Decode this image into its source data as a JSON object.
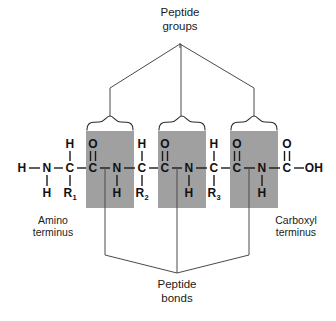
{
  "figure": {
    "title_top": {
      "line1": "Peptide",
      "line2": "groups"
    },
    "title_bottom": {
      "line1": "Peptide",
      "line2": "bonds"
    },
    "label_left": {
      "line1": "Amino",
      "line2": "terminus"
    },
    "label_right": {
      "line1": "Carboxyl",
      "line2": "terminus"
    },
    "colors": {
      "highlight_box": "#a0a0a0",
      "stroke": "#4a4a4a",
      "text": "#111111",
      "background": "#ffffff"
    }
  },
  "backbone": {
    "description": "Tripeptide backbone drawn left to right",
    "main_chain": [
      {
        "id": "h-n-terminal",
        "text": "H",
        "x": 22,
        "y": 168
      },
      {
        "id": "n-terminal",
        "text": "N",
        "x": 47,
        "y": 168
      },
      {
        "id": "c-alpha-1",
        "text": "C",
        "x": 70,
        "y": 168
      },
      {
        "id": "c-carbonyl-1",
        "text": "C",
        "x": 93,
        "y": 168
      },
      {
        "id": "n-amide-1",
        "text": "N",
        "x": 117,
        "y": 168
      },
      {
        "id": "c-alpha-2",
        "text": "C",
        "x": 142,
        "y": 168
      },
      {
        "id": "c-carbonyl-2",
        "text": "C",
        "x": 165,
        "y": 168
      },
      {
        "id": "n-amide-2",
        "text": "N",
        "x": 189,
        "y": 168
      },
      {
        "id": "c-alpha-3",
        "text": "C",
        "x": 214,
        "y": 168
      },
      {
        "id": "c-carbonyl-3",
        "text": "C",
        "x": 237,
        "y": 168
      },
      {
        "id": "n-amide-3",
        "text": "N",
        "x": 262,
        "y": 168
      },
      {
        "id": "c-carboxyl",
        "text": "C",
        "x": 287,
        "y": 168
      },
      {
        "id": "oh-c-terminal",
        "text": "OH",
        "x": 314,
        "y": 168
      }
    ],
    "substituents": [
      {
        "id": "oxygen-1",
        "text": "O",
        "x": 93,
        "y": 144
      },
      {
        "id": "oxygen-2",
        "text": "O",
        "x": 165,
        "y": 144
      },
      {
        "id": "oxygen-3",
        "text": "O",
        "x": 237,
        "y": 144
      },
      {
        "id": "oxygen-carboxyl",
        "text": "O",
        "x": 287,
        "y": 144
      },
      {
        "id": "h-alpha-1",
        "text": "H",
        "x": 70,
        "y": 144
      },
      {
        "id": "h-alpha-2",
        "text": "H",
        "x": 142,
        "y": 144
      },
      {
        "id": "h-alpha-3",
        "text": "H",
        "x": 214,
        "y": 144
      },
      {
        "id": "h-n-terminal-lower",
        "text": "H",
        "x": 47,
        "y": 193
      },
      {
        "id": "h-amide-1",
        "text": "H",
        "x": 117,
        "y": 193
      },
      {
        "id": "h-amide-2",
        "text": "H",
        "x": 189,
        "y": 193
      },
      {
        "id": "h-amide-3",
        "text": "H",
        "x": 262,
        "y": 193
      },
      {
        "id": "r-group-1",
        "text": "R",
        "sub": "1",
        "x": 70,
        "y": 193
      },
      {
        "id": "r-group-2",
        "text": "R",
        "sub": "2",
        "x": 142,
        "y": 193
      },
      {
        "id": "r-group-3",
        "text": "R",
        "sub": "3",
        "x": 214,
        "y": 193
      }
    ]
  },
  "peptide_group_boxes": [
    {
      "id": "peptide-group-1",
      "x": 86,
      "y": 131,
      "width": 48,
      "height": 77
    },
    {
      "id": "peptide-group-2",
      "x": 158,
      "y": 131,
      "width": 48,
      "height": 77
    },
    {
      "id": "peptide-group-3",
      "x": 230,
      "y": 131,
      "width": 48,
      "height": 77
    }
  ],
  "braces": [
    {
      "id": "brace-1",
      "left": 86,
      "right": 134,
      "y": 124,
      "tip_x": 110
    },
    {
      "id": "brace-2",
      "left": 158,
      "right": 206,
      "y": 124,
      "tip_x": 182
    },
    {
      "id": "brace-3",
      "left": 230,
      "right": 278,
      "y": 124,
      "tip_x": 254
    }
  ],
  "peptide_bond_pointers": [
    {
      "id": "bond-pointer-1",
      "x": 105,
      "top": 168,
      "drop": 255
    },
    {
      "id": "bond-pointer-2",
      "x": 177,
      "top": 168,
      "drop": 255
    },
    {
      "id": "bond-pointer-3",
      "x": 249,
      "top": 168,
      "drop": 255
    }
  ],
  "connector_apex": {
    "top_x": 180,
    "top_y": 43,
    "bottom_x": 177,
    "bottom_y": 273
  }
}
